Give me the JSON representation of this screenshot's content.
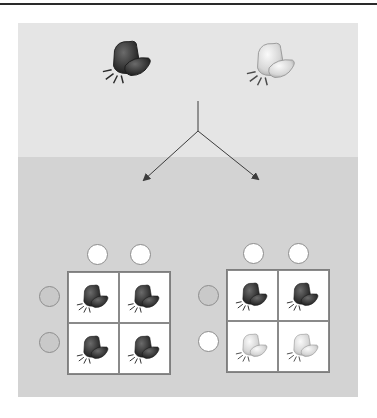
{
  "diagram": {
    "type": "genetic-cross-punnett-squares",
    "colors": {
      "panel_top": "#e5e5e5",
      "panel_bottom": "#d3d3d3",
      "allele_dominant": "#c9c9c9",
      "allele_recessive": "#ffffff",
      "flower_dark": "#3a3a3a",
      "flower_light": "#e6e6e6",
      "arrow": "#3c3c3c"
    },
    "parents": [
      {
        "id": "parent-dark",
        "phenotype": "dark-flower"
      },
      {
        "id": "parent-light",
        "phenotype": "light-flower"
      }
    ],
    "crosses": [
      {
        "id": "cross-left",
        "column_alleles": [
          "recessive",
          "recessive"
        ],
        "row_alleles": [
          "dominant",
          "dominant"
        ],
        "offspring": [
          [
            "dark-flower",
            "dark-flower"
          ],
          [
            "dark-flower",
            "dark-flower"
          ]
        ]
      },
      {
        "id": "cross-right",
        "column_alleles": [
          "recessive",
          "recessive"
        ],
        "row_alleles": [
          "dominant",
          "recessive"
        ],
        "offspring": [
          [
            "dark-flower",
            "dark-flower"
          ],
          [
            "light-flower",
            "light-flower"
          ]
        ]
      }
    ]
  }
}
